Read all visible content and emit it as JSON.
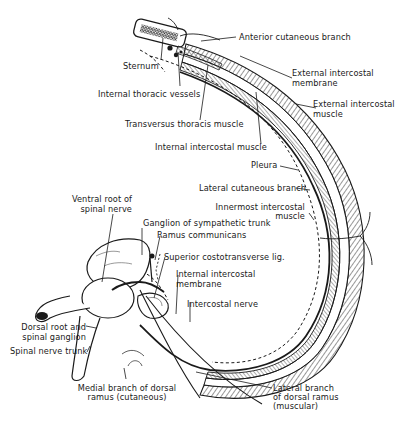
{
  "figure": {
    "ink_color": "#1a1a1a",
    "background": "#ffffff"
  },
  "labels": {
    "anterior_cutaneous_branch": "Anterior cutaneous branch",
    "sternum": "Sternum",
    "external_intercostal_membrane_1": "External intercostal",
    "external_intercostal_membrane_2": "membrane",
    "internal_thoracic_vessels": "Internal thoracic vessels",
    "external_intercostal_muscle_1": "External intercostal",
    "external_intercostal_muscle_2": "muscle",
    "transversus_thoracis_muscle": "Transversus thoracis muscle",
    "internal_intercostal_muscle": "Internal intercostal muscle",
    "pleura": "Pleura",
    "lateral_cutaneous_branch": "Lateral cutaneous branch",
    "innermost_intercostal_muscle_1": "Innermost intercostal",
    "innermost_intercostal_muscle_2": "muscle",
    "ventral_root_1": "Ventral root of",
    "ventral_root_2": "spinal nerve",
    "ganglion_sympathetic_trunk": "Ganglion of sympathetic trunk",
    "ramus_communicans": "Ramus communicans",
    "superior_costotransverse_lig": "Superior costotransverse lig.",
    "internal_intercostal_membrane_1": "Internal intercostal",
    "internal_intercostal_membrane_2": "membrane",
    "intercostal_nerve": "Intercostal nerve",
    "dorsal_root_1": "Dorsal root and",
    "dorsal_root_2": "spinal ganglion",
    "spinal_nerve_trunk": "Spinal nerve trunk",
    "medial_branch_1": "Medial branch of dorsal",
    "medial_branch_2": "ramus (cutaneous)",
    "lateral_branch_1": "Lateral branch",
    "lateral_branch_2": "of dorsal ramus",
    "lateral_branch_3": "(muscular)"
  }
}
